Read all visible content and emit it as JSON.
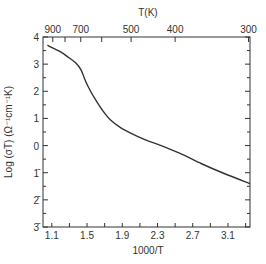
{
  "chart_data": {
    "type": "line",
    "title": "",
    "xlabel": "1000/T",
    "ylabel": "Log (σT) (Ω⁻¹cm⁻¹K)",
    "top_xlabel": "T(K)",
    "xlim": [
      1.0,
      3.35
    ],
    "ylim": [
      -3,
      4
    ],
    "grid": false,
    "legend": null,
    "x_ticks": [
      1.1,
      1.5,
      1.9,
      2.3,
      2.7,
      3.1
    ],
    "x_tick_labels": [
      "1.1",
      "1.5",
      "1.9",
      "2.3",
      "2.7",
      "3.1"
    ],
    "x_minor_ticks": [
      1.1,
      1.3,
      1.5,
      1.7,
      1.9,
      2.1,
      2.3,
      2.5,
      2.7,
      2.9,
      3.1,
      3.3
    ],
    "y_ticks": [
      4,
      3,
      2,
      1,
      0,
      -1,
      -2,
      -3
    ],
    "y_tick_labels": [
      "4",
      "3",
      "2",
      "1",
      "0",
      "1̄",
      "2̄",
      "3̄"
    ],
    "top_ticks_K": [
      900,
      800,
      700,
      600,
      500,
      400,
      300
    ],
    "top_tick_labels": [
      "900",
      "700",
      "500",
      "400",
      "300"
    ],
    "top_labeled_K": [
      900,
      700,
      500,
      400,
      300
    ],
    "series": [
      {
        "name": "Log(σT)",
        "x": [
          1.05,
          1.12,
          1.2,
          1.28,
          1.37,
          1.43,
          1.48,
          1.54,
          1.6,
          1.68,
          1.77,
          1.88,
          2.0,
          2.17,
          2.34,
          2.55,
          2.8,
          3.05,
          3.35
        ],
        "y": [
          3.7,
          3.58,
          3.45,
          3.27,
          3.05,
          2.8,
          2.4,
          2.0,
          1.67,
          1.28,
          0.93,
          0.66,
          0.45,
          0.2,
          0.0,
          -0.28,
          -0.67,
          -1.02,
          -1.4
        ]
      }
    ]
  }
}
